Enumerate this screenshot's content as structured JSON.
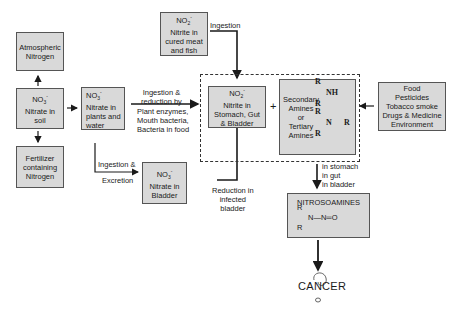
{
  "diagram": {
    "type": "flowchart",
    "nodes": {
      "atmospheric_nitrogen": {
        "label": "Atmospheric Nitrogen",
        "line1": "Atmospheric",
        "line2": "Nitrogen"
      },
      "nitrate_soil": {
        "formula": "NO",
        "sub": "3",
        "sup": "-",
        "line1": "Nitrate in",
        "line2": "soil"
      },
      "fertilizer": {
        "line1": "Fertilizer",
        "line2": "containing",
        "line3": "Nitrogen"
      },
      "nitrate_plants": {
        "formula": "NO",
        "sub": "3",
        "sup": "-",
        "line1": "Nitrate in",
        "line2": "plants and",
        "line3": "water"
      },
      "nitrite_meat": {
        "formula": "NO",
        "sub": "2",
        "sup": "-",
        "line1": "Nitrite in",
        "line2": "cured meat",
        "line3": "and fish"
      },
      "nitrite_stomach": {
        "formula": "NO",
        "sub": "2",
        "sup": "-",
        "line1": "Nitrite in",
        "line2": "Stomach, Gut",
        "line3": "& Bladder"
      },
      "amines": {
        "line1": "Secondary",
        "line2": "Amines",
        "line3": "or",
        "line4": "Tertiary",
        "line5": "Amines",
        "chem_r": "R",
        "chem_nh": "NH",
        "chem_n": "N",
        "chem_nr": "R"
      },
      "sources": {
        "line1": "Food",
        "line2": "Pesticides",
        "line3": "Tobacco smoke",
        "line4": "Drugs & Medicine",
        "line5": "Environment"
      },
      "nitrate_bladder": {
        "formula": "NO",
        "sub": "3",
        "sup": "-",
        "line1": "Nitrate in",
        "line2": "Bladder"
      },
      "nitrosamines": {
        "title": "NITROSOAMINES",
        "chem_r": "R",
        "chem_chain": "N—N═O"
      },
      "cancer": {
        "label": "CANCER"
      }
    },
    "edge_labels": {
      "ingestion_reduction": {
        "line1": "Ingestion &",
        "line2": "reduction by",
        "line3": "Plant enzymes,",
        "line4": "Mouth bacteria,",
        "line5": "Bacteria in food"
      },
      "ingestion_excretion": {
        "line1": "Ingestion &",
        "line2": "Excretion"
      },
      "ingestion": {
        "line1": "Ingestion"
      },
      "reduction_bladder": {
        "line1": "Reduction in",
        "line2": "infected",
        "line3": "bladder"
      },
      "in_stomach": {
        "line1": "in stomach",
        "line2": "in gut",
        "line3": "in bladder"
      },
      "plus": "+"
    },
    "colors": {
      "box_fill": "#d9d9d9",
      "box_border": "#555555",
      "line": "#1a1a1a",
      "background": "#ffffff"
    }
  }
}
